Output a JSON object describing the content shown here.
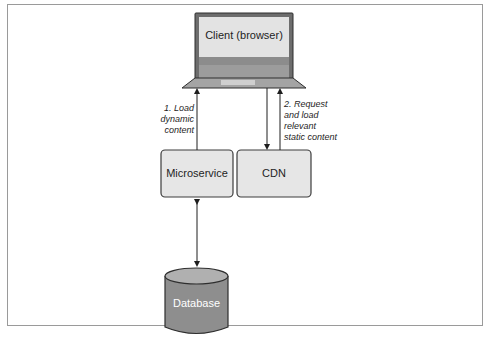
{
  "diagram": {
    "nodes": {
      "client": {
        "label": "Client (browser)",
        "shape": "laptop-icon"
      },
      "microservice": {
        "label": "Microservice",
        "shape": "rounded-rect"
      },
      "cdn": {
        "label": "CDN",
        "shape": "rounded-rect"
      },
      "database": {
        "label": "Database",
        "shape": "cylinder"
      }
    },
    "edges": [
      {
        "from": "microservice",
        "to": "client",
        "label": "1. Load dynamic content",
        "label_lines": [
          "1. Load",
          "dynamic",
          "content"
        ],
        "direction": "up"
      },
      {
        "from": "client",
        "to": "cdn",
        "label": "",
        "direction": "down"
      },
      {
        "from": "cdn",
        "to": "client",
        "label": "2. Request and load relevant static content",
        "label_lines": [
          "2. Request",
          "and load",
          "relevant",
          "static content"
        ],
        "direction": "up"
      },
      {
        "from": "microservice",
        "to": "database",
        "label": "",
        "direction": "bidirectional"
      }
    ],
    "colors": {
      "box_fill": "#e6e6e6",
      "box_stroke": "#3c3c3c",
      "laptop_screen": "#e3e3e3",
      "laptop_frame": "#6d6d6d",
      "laptop_band": "#8c8c8c",
      "laptop_base": "#a4a4a4",
      "database_fill": "#8e8e8e",
      "database_top": "#b0b0b0",
      "database_text": "#ffffff",
      "arrow": "#1e1e1e"
    }
  }
}
